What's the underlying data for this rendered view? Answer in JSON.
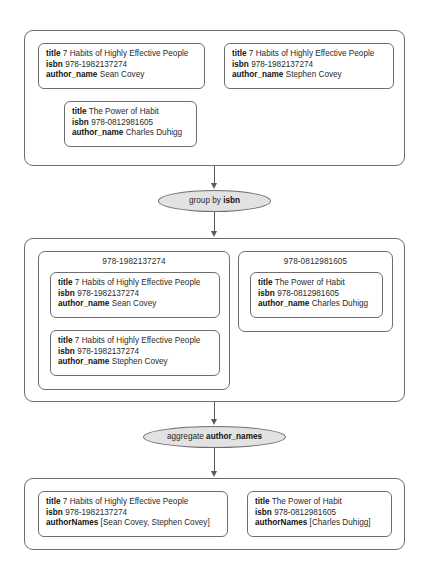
{
  "diagram": {
    "type": "dataflow-pipeline",
    "title": "",
    "colors": {
      "stroke": "#6e6e6e",
      "connector": "#5a5a5a",
      "operation_fill": "#e2e2e2",
      "background": "#ffffff",
      "text": "#2b2b2b"
    },
    "field_labels": {
      "title": "title",
      "isbn": "isbn",
      "author_name": "author_name",
      "author_names": "authorNames"
    },
    "stages": [
      {
        "id": "input",
        "name": "input-records",
        "records": [
          {
            "title_label": "title",
            "title_value": "7 Habits of Highly Effective People",
            "isbn_label": "isbn",
            "isbn_value": "978-1982137274",
            "author_label": "author_name",
            "author_value": "Sean Covey"
          },
          {
            "title_label": "title",
            "title_value": "7 Habits of Highly Effective People",
            "isbn_label": "isbn",
            "isbn_value": "978-1982137274",
            "author_label": "author_name",
            "author_value": "Stephen Covey"
          },
          {
            "title_label": "title",
            "title_value": "The Power of Habit",
            "isbn_label": "isbn",
            "isbn_value": "978-0812981605",
            "author_label": "author_name",
            "author_value": "Charles Duhigg"
          }
        ]
      },
      {
        "id": "grouped",
        "name": "grouped-records",
        "groups": [
          {
            "key": "978-1982137274",
            "records": [
              {
                "title_label": "title",
                "title_value": "7 Habits of Highly Effective People",
                "isbn_label": "isbn",
                "isbn_value": "978-1982137274",
                "author_label": "author_name",
                "author_value": "Sean Covey"
              },
              {
                "title_label": "title",
                "title_value": "7 Habits of Highly Effective People",
                "isbn_label": "isbn",
                "isbn_value": "978-1982137274",
                "author_label": "author_name",
                "author_value": "Stephen Covey"
              }
            ]
          },
          {
            "key": "978-0812981605",
            "records": [
              {
                "title_label": "title",
                "title_value": "The Power of Habit",
                "isbn_label": "isbn",
                "isbn_value": "978-0812981605",
                "author_label": "author_name",
                "author_value": "Charles Duhigg"
              }
            ]
          }
        ]
      },
      {
        "id": "aggregated",
        "name": "aggregated-records",
        "records": [
          {
            "title_label": "title",
            "title_value": "7 Habits of Highly Effective People",
            "isbn_label": "isbn",
            "isbn_value": "978-1982137274",
            "author_label": "authorNames",
            "author_value": "[Sean Covey, Stephen Covey]"
          },
          {
            "title_label": "title",
            "title_value": "The Power of Habit",
            "isbn_label": "isbn",
            "isbn_value": "978-0812981605",
            "author_label": "authorNames",
            "author_value": "[Charles Duhigg]"
          }
        ]
      }
    ],
    "operations": [
      {
        "id": "group-by",
        "prefix": "group by ",
        "field": "isbn"
      },
      {
        "id": "aggregate",
        "prefix": "aggregate ",
        "field": "author_names"
      }
    ]
  }
}
